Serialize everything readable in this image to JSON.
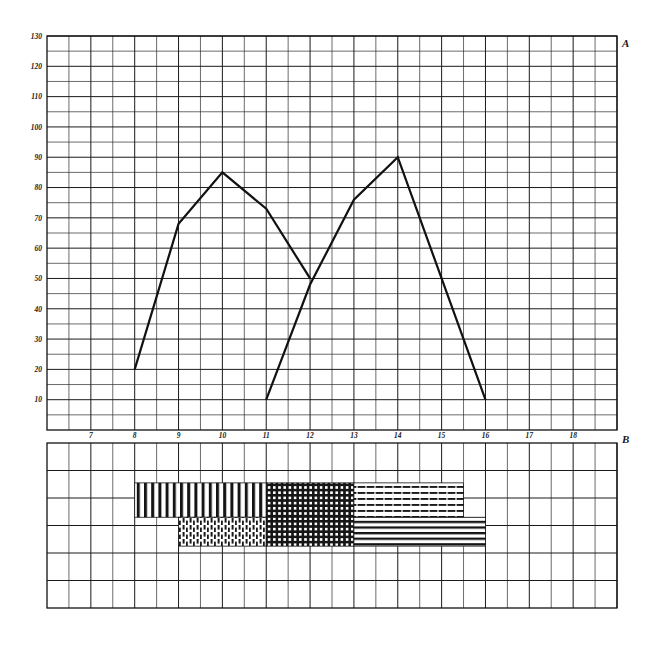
{
  "figure": {
    "background": "#ffffff",
    "ink_color": "#111111",
    "grid_color": "#2b2b2b"
  },
  "upper_panel": {
    "corner_label": "A",
    "y_ticks": [
      10,
      20,
      30,
      40,
      50,
      60,
      70,
      80,
      90,
      100,
      110,
      120,
      130
    ],
    "y_tick_labels": [
      "10",
      "20",
      "30",
      "40",
      "50",
      "60",
      "70",
      "80",
      "90",
      "100",
      "110",
      "120",
      "130"
    ]
  },
  "lower_panel": {
    "corner_label": "B",
    "x_ticks": [
      7,
      8,
      9,
      10,
      11,
      12,
      13,
      14,
      15,
      16,
      17,
      18
    ],
    "x_tick_labels": [
      "7",
      "8",
      "9",
      "10",
      "11",
      "12",
      "13",
      "14",
      "15",
      "16",
      "17",
      "18"
    ]
  },
  "chart_data": {
    "type": "line",
    "title": "",
    "xlabel": "B",
    "ylabel": "A",
    "xlim": [
      6,
      19
    ],
    "ylim": [
      0,
      130
    ],
    "grid": true,
    "legend": "none",
    "x_ticks": [
      7,
      8,
      9,
      10,
      11,
      12,
      13,
      14,
      15,
      16,
      17,
      18
    ],
    "y_ticks": [
      10,
      20,
      30,
      40,
      50,
      60,
      70,
      80,
      90,
      100,
      110,
      120,
      130
    ],
    "series": [
      {
        "name": "curve-1",
        "x": [
          8,
          9,
          10,
          11,
          12
        ],
        "values": [
          20,
          68,
          85,
          73,
          50
        ]
      },
      {
        "name": "curve-2",
        "x": [
          11,
          12,
          13,
          14,
          16
        ],
        "values": [
          10,
          48,
          76,
          90,
          10
        ]
      }
    ],
    "bars": {
      "type": "stacked-horizontal-bands",
      "rows": [
        {
          "name": "upper-band",
          "y_top": 4.55,
          "y_bottom": 3.3,
          "segments": [
            {
              "name": "vertical-hatch",
              "x_start": 8,
              "x_end": 11,
              "pattern": "vertical-lines"
            },
            {
              "name": "cross-hatch",
              "x_start": 11,
              "x_end": 13,
              "pattern": "crosshatch"
            },
            {
              "name": "dashed-horizontal",
              "x_start": 13,
              "x_end": 15.5,
              "pattern": "dashed-horizontal-lines"
            }
          ]
        },
        {
          "name": "lower-band",
          "y_top": 3.3,
          "y_bottom": 2.25,
          "segments": [
            {
              "name": "dashed-vertical",
              "x_start": 9,
              "x_end": 11,
              "pattern": "dashed-vertical-lines"
            },
            {
              "name": "cross-hatch",
              "x_start": 11,
              "x_end": 13,
              "pattern": "crosshatch"
            },
            {
              "name": "solid-horizontal",
              "x_start": 13,
              "x_end": 16,
              "pattern": "solid-horizontal-lines"
            }
          ]
        }
      ]
    }
  }
}
